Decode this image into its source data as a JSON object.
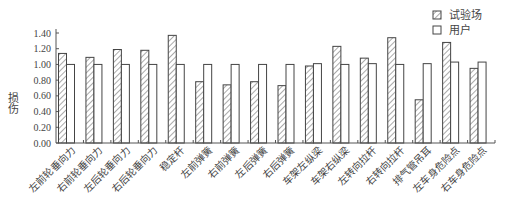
{
  "chart_data": {
    "type": "bar",
    "title": "",
    "xlabel": "",
    "ylabel": "损伤",
    "ylim": [
      0,
      1.4
    ],
    "yticks": [
      "0.00",
      "0.20",
      "0.40",
      "0.60",
      "0.80",
      "1.00",
      "1.20",
      "1.40"
    ],
    "grid": false,
    "legend_position": "top-right",
    "categories": [
      "左前轮垂向力",
      "右前轮垂向力",
      "左后轮垂向力",
      "右后轮垂向力",
      "稳定杆",
      "左前弹簧",
      "右前弹簧",
      "左后弹簧",
      "右后弹簧",
      "车架左纵梁",
      "车架右纵梁",
      "左转向拉杆",
      "右转向拉杆",
      "排气管吊耳",
      "左车身危险点",
      "右车身危险点"
    ],
    "series": [
      {
        "name": "试验场",
        "pattern": "hatched",
        "values": [
          1.14,
          1.09,
          1.19,
          1.18,
          1.37,
          0.78,
          0.74,
          0.78,
          0.73,
          0.98,
          1.23,
          1.08,
          1.34,
          0.55,
          1.28,
          0.95
        ]
      },
      {
        "name": "用户",
        "pattern": "empty",
        "values": [
          1.0,
          1.0,
          1.0,
          1.0,
          1.0,
          1.0,
          1.0,
          1.0,
          1.0,
          1.01,
          1.0,
          1.01,
          1.0,
          1.01,
          1.03,
          1.03
        ]
      }
    ]
  },
  "legend": {
    "items": [
      {
        "label": "试验场"
      },
      {
        "label": "用户"
      }
    ]
  },
  "axis": {
    "ylabel": "损伤"
  }
}
